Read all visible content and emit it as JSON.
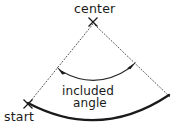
{
  "diagram": {
    "kind": "geometry-diagram",
    "background_color": "#ffffff",
    "ink_color": "#1a1a1a",
    "labels": {
      "center": "center",
      "start": "start",
      "included": "included",
      "angle": "angle"
    },
    "markers": [
      {
        "name": "center-cross",
        "glyph": "x-mark",
        "x": 93,
        "y": 22
      },
      {
        "name": "start-cross",
        "glyph": "x-mark",
        "x": 28,
        "y": 104
      }
    ],
    "radii": [
      {
        "name": "start-radius",
        "style": "dotted",
        "from": {
          "x": 93,
          "y": 22
        },
        "to": {
          "x": 28,
          "y": 104
        }
      },
      {
        "name": "end-radius",
        "style": "dotted",
        "from": {
          "x": 93,
          "y": 22
        },
        "to": {
          "x": 170,
          "y": 96
        }
      }
    ],
    "arcs": [
      {
        "name": "outer-arc",
        "style": "solid-thick",
        "from": {
          "x": 28,
          "y": 104
        },
        "to": {
          "x": 169,
          "y": 95
        },
        "lowest_point": {
          "x": 101,
          "y": 128
        }
      },
      {
        "name": "angle-arc",
        "style": "solid-thin",
        "arrowheads": "both",
        "from": {
          "x": 61,
          "y": 71
        },
        "to": {
          "x": 131,
          "y": 67
        },
        "lowest_point": {
          "x": 96,
          "y": 82
        }
      }
    ]
  }
}
